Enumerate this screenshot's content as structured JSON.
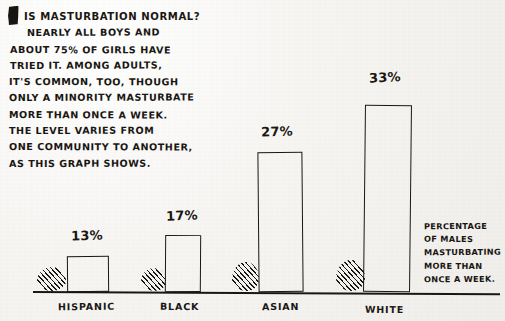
{
  "article": {
    "heading": "IS MASTURBATION NORMAL?",
    "dropcap": "I",
    "lines": [
      "IS MASTURBATION NORMAL?",
      "NEARLY ALL BOYS AND",
      "ABOUT 75% OF GIRLS HAVE",
      "TRIED IT. AMONG ADULTS,",
      "IT'S COMMON, TOO, THOUGH",
      "ONLY A MINORITY MASTURBATE",
      "MORE THAN ONCE A WEEK.",
      "THE LEVEL VARIES FROM",
      "ONE COMMUNITY TO ANOTHER,",
      "AS THIS GRAPH SHOWS."
    ]
  },
  "caption": {
    "lines": [
      "PERCENTAGE",
      "OF MALES",
      "MASTURBATING",
      "MORE THAN",
      "ONCE A WEEK."
    ]
  },
  "chart_data": {
    "type": "bar",
    "title": "",
    "xlabel": "",
    "ylabel": "PERCENTAGE OF MALES MASTURBATING MORE THAN ONCE A WEEK.",
    "categories": [
      "HISPANIC",
      "BLACK",
      "ASIAN",
      "WHITE"
    ],
    "values": [
      13,
      17,
      27,
      33
    ],
    "value_labels": [
      "13%",
      "17%",
      "27%",
      "33%"
    ],
    "ylim": [
      0,
      35
    ],
    "grid": false,
    "legend": "none",
    "ink_color": "#1a1713",
    "paper_color": "#f4f3f0"
  }
}
